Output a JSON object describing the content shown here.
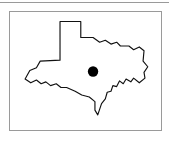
{
  "figure": {
    "kind": "state-locator-map",
    "frame": {
      "border_color": "#9a9a9a",
      "background_color": "#ffffff",
      "x": 9,
      "y": 11,
      "width": 153,
      "height": 120
    },
    "top_rule": {
      "color": "#9a9a9a",
      "x": 0,
      "y": 2,
      "width": 169,
      "height": 1
    }
  },
  "map": {
    "region_name": "Texas",
    "outline_color": "#111111",
    "fill_color": "#ffffff",
    "outline_points": "53 51, 53 10, 75 10, 75 27, 88 27, 95 32, 101 30, 107 34, 113 32, 117 36, 126 36, 131 40, 137 37, 142 41, 141 52, 146 58, 142 64, 143 70, 137 75, 131 70, 128 74, 123 71, 120 76, 116 73, 113 79, 109 78, 107 84, 103 85, 101 92, 97 97, 93 109, 90 104, 90 95, 84 90, 76 88, 69 84, 60 80, 54 80, 49 76, 43 78, 38 74, 33 76, 28 72, 22 75, 16 71, 21 62, 28 59, 32 52",
    "marker": {
      "label": "location-dot",
      "color": "#000000",
      "cx": 88,
      "cy": 63,
      "r": 5.5
    }
  }
}
